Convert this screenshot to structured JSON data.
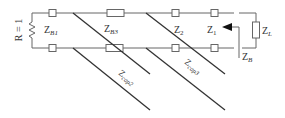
{
  "diagram": {
    "type": "circuit",
    "source_resistor": "R = 1",
    "labels": {
      "zb1": {
        "main": "Z",
        "sub": "B1"
      },
      "zb3": {
        "main": "Z",
        "sub": "B3"
      },
      "z2": {
        "main": "Z",
        "sub": "2"
      },
      "z1": {
        "main": "Z",
        "sub": "1"
      },
      "zl": {
        "main": "Z",
        "sub": "L"
      },
      "zb": {
        "main": "Z",
        "sub": "B"
      },
      "zcap2": {
        "main": "Z",
        "sub": "cap2"
      },
      "zcap3": {
        "main": "Z",
        "sub": "cap3"
      }
    },
    "colors": {
      "wire": "#555555",
      "diagonal": "#333333",
      "text": "#333333"
    }
  }
}
